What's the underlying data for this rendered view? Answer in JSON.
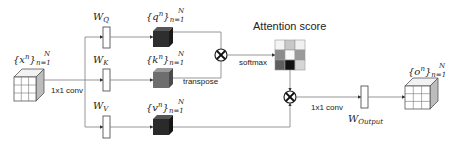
{
  "title": "Attention score",
  "input": {
    "label_base": "{x",
    "label_sup": "n",
    "label_close": "}",
    "label_sub": "n=1",
    "label_top": "N"
  },
  "output": {
    "label_base": "{o",
    "label_sup": "n",
    "label_close": "}",
    "label_sub": "n=1",
    "label_top": "N"
  },
  "weights": {
    "q": {
      "base": "W",
      "sub": "Q"
    },
    "k": {
      "base": "W",
      "sub": "K"
    },
    "v": {
      "base": "W",
      "sub": "V"
    },
    "out": {
      "base": "W",
      "sub": "Output"
    }
  },
  "tensors": {
    "q": {
      "base": "{q",
      "sup": "n",
      "close": "}",
      "sub": "n=1",
      "top": "N"
    },
    "k": {
      "base": "{k",
      "sup": "n",
      "close": "}",
      "sub": "n=1",
      "top": "N"
    },
    "v": {
      "base": "{v",
      "sup": "n",
      "close": "}",
      "sub": "n=1",
      "top": "N"
    }
  },
  "labels": {
    "conv_in": "1x1 conv",
    "conv_out": "1x1 conv",
    "transpose": "transpose",
    "softmax": "softmax"
  },
  "attention_grid": {
    "rows": 3,
    "cols": 3,
    "cells": [
      "#f4f4f4",
      "#c8c8c8",
      "#f0f0f0",
      "#8c8c8c",
      "#fafafa",
      "#9a9a9a",
      "#5e5e5e",
      "#111111",
      "#d6d6d6"
    ]
  },
  "colors": {
    "query_cube": "#2e2e2e",
    "key_cube": "#6e6e6e",
    "value_cube": "#2a2a2a",
    "line": "#8a8a8a"
  },
  "operators": [
    "multiply",
    "multiply"
  ]
}
